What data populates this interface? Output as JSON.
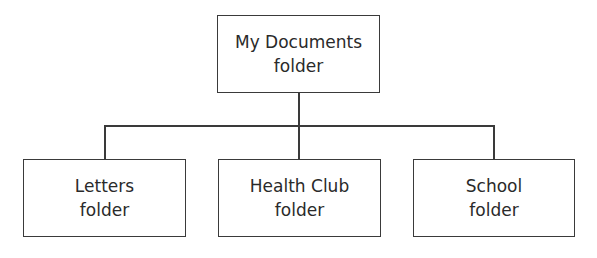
{
  "diagram": {
    "type": "folder-hierarchy",
    "root": {
      "line1": "My Documents",
      "line2": "folder"
    },
    "children": [
      {
        "line1": "Letters",
        "line2": "folder"
      },
      {
        "line1": "Health Club",
        "line2": "folder"
      },
      {
        "line1": "School",
        "line2": "folder"
      }
    ],
    "colors": {
      "stroke": "#3a3a3a",
      "text": "#2a2a2a",
      "background": "#ffffff"
    }
  }
}
